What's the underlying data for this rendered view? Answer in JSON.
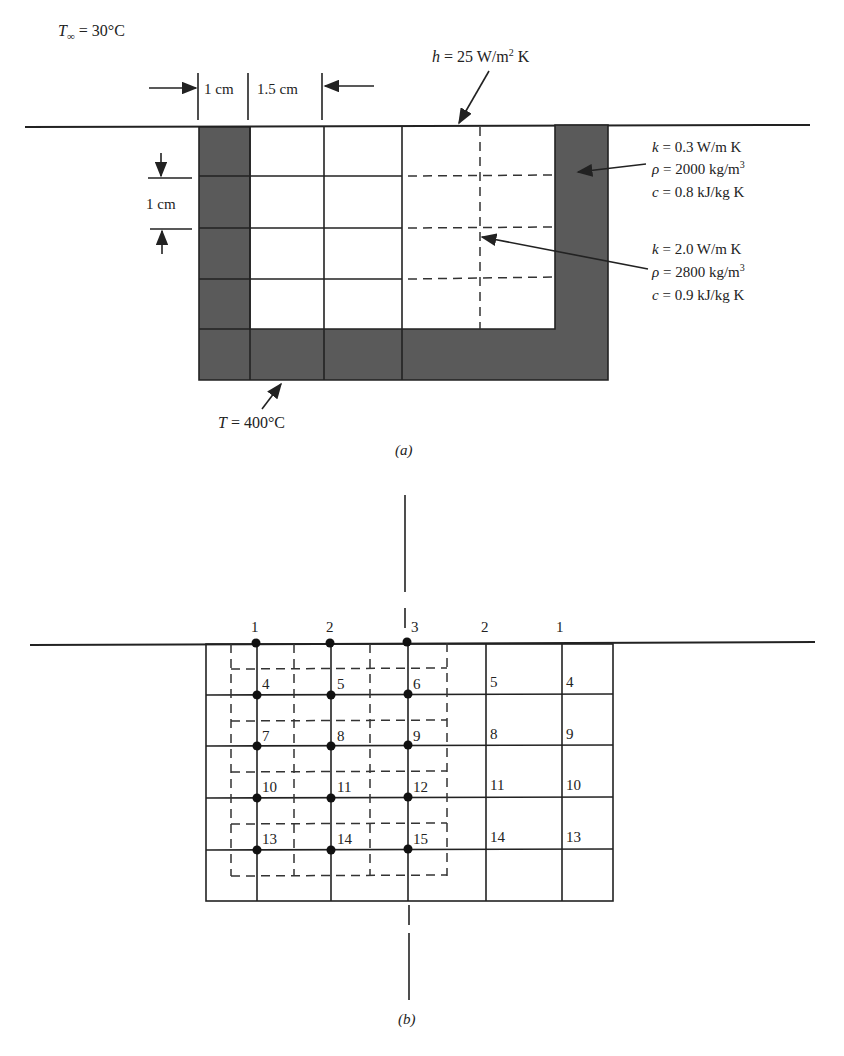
{
  "part_a": {
    "ambient_label_sym": "T",
    "ambient_label_sub": "∞",
    "ambient_label_val": " = 30°C",
    "convection_label_sym": "h",
    "convection_label_val": " = 25 W/m",
    "convection_label_exp": "2",
    "convection_label_unit": " K",
    "dim_wall_width": "1 cm",
    "dim_cell_width": "1.5 cm",
    "dim_cell_height": "1 cm",
    "outer_material": {
      "k_sym": "k",
      "k_val": " = 0.3 W/m K",
      "rho_sym": "ρ",
      "rho_val": " = 2000 kg/m",
      "rho_exp": "3",
      "c_sym": "c",
      "c_val": " = 0.8 kJ/kg K"
    },
    "inner_material": {
      "k_sym": "k",
      "k_val": " = 2.0 W/m K",
      "rho_sym": "ρ",
      "rho_val": " = 2800 kg/m",
      "rho_exp": "3",
      "c_sym": "c",
      "c_val": " = 0.9 kJ/kg K"
    },
    "base_temp_sym": "T",
    "base_temp_val": " = 400°C",
    "caption": "(a)"
  },
  "part_b": {
    "top_node_labels": [
      "1",
      "2",
      "3",
      "2",
      "1"
    ],
    "left_cell_labels": [
      [
        "4",
        "5",
        "6"
      ],
      [
        "7",
        "8",
        "9"
      ],
      [
        "10",
        "11",
        "12"
      ],
      [
        "13",
        "14",
        "15"
      ]
    ],
    "right_cell_labels": [
      [
        "5",
        "4"
      ],
      [
        "8",
        "9"
      ],
      [
        "11",
        "10"
      ],
      [
        "14",
        "13"
      ]
    ],
    "caption": "(b)"
  },
  "colors": {
    "insulation_fill": "#5a5a5a",
    "line": "#222222"
  }
}
